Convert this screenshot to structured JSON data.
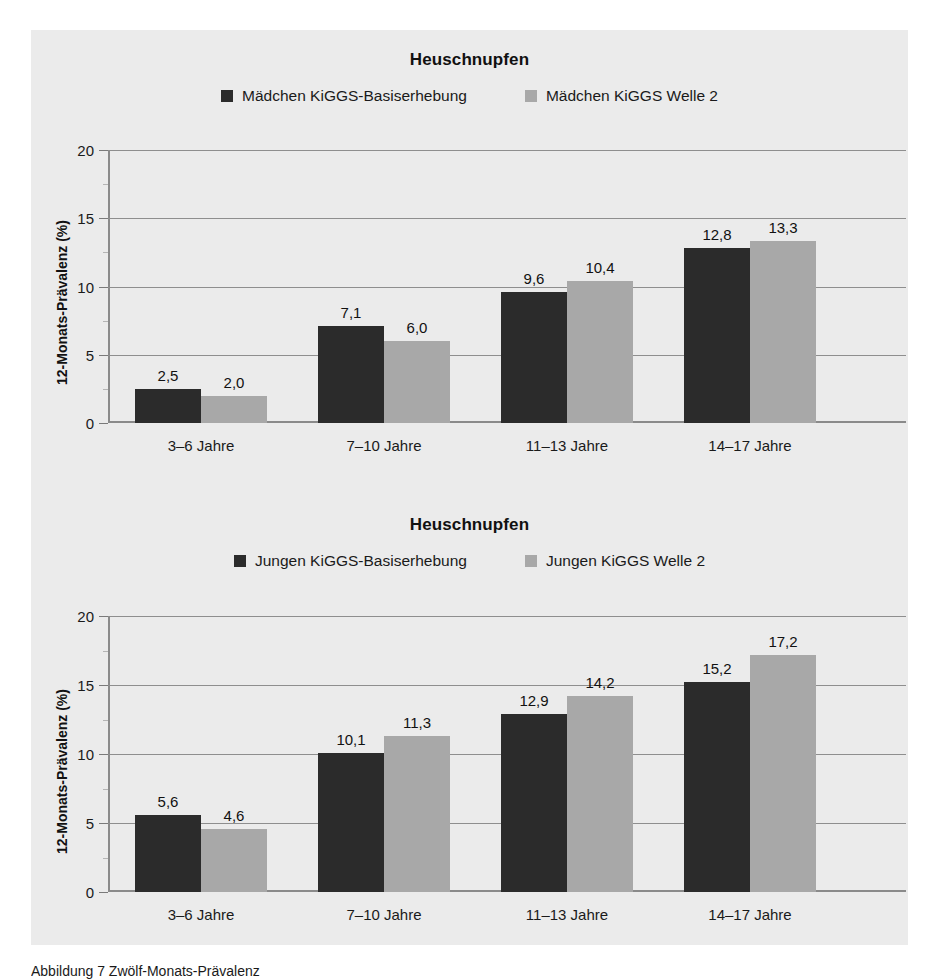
{
  "figure": {
    "caption": "Abbildung 7 Zwölf-Monats-Prävalenz"
  },
  "colors": {
    "series_baseline": "#2b2b2b",
    "series_welle2": "#a8a8a8",
    "panel_background": "#ebebeb",
    "axis": "#8a8a8a",
    "grid": "#8e8e8e",
    "text": "#1a1a1a"
  },
  "charts": [
    {
      "id": "maedchen",
      "title": "Heuschnupfen",
      "ylabel": "12-Monats-Prävalenz (%)",
      "legend": [
        {
          "label": "Mädchen KiGGS-Basiserhebung",
          "swatch": "#2b2b2b"
        },
        {
          "label": "Mädchen KiGGS Welle 2",
          "swatch": "#a8a8a8"
        }
      ],
      "yticks": [
        "0",
        "5",
        "10",
        "15",
        "20"
      ],
      "categories": [
        "3–6 Jahre",
        "7–10 Jahre",
        "11–13 Jahre",
        "14–17 Jahre"
      ],
      "bars": [
        {
          "value": 2.5,
          "label": "2,5",
          "series": 0
        },
        {
          "value": 2.0,
          "label": "2,0",
          "series": 1
        },
        {
          "value": 7.1,
          "label": "7,1",
          "series": 0
        },
        {
          "value": 6.0,
          "label": "6,0",
          "series": 1
        },
        {
          "value": 9.6,
          "label": "9,6",
          "series": 0
        },
        {
          "value": 10.4,
          "label": "10,4",
          "series": 1
        },
        {
          "value": 12.8,
          "label": "12,8",
          "series": 0
        },
        {
          "value": 13.3,
          "label": "13,3",
          "series": 1
        }
      ]
    },
    {
      "id": "jungen",
      "title": "Heuschnupfen",
      "ylabel": "12-Monats-Prävalenz (%)",
      "legend": [
        {
          "label": "Jungen KiGGS-Basiserhebung",
          "swatch": "#2b2b2b"
        },
        {
          "label": "Jungen KiGGS Welle 2",
          "swatch": "#a8a8a8"
        }
      ],
      "yticks": [
        "0",
        "5",
        "10",
        "15",
        "20"
      ],
      "categories": [
        "3–6 Jahre",
        "7–10 Jahre",
        "11–13 Jahre",
        "14–17 Jahre"
      ],
      "bars": [
        {
          "value": 5.6,
          "label": "5,6",
          "series": 0
        },
        {
          "value": 4.6,
          "label": "4,6",
          "series": 1
        },
        {
          "value": 10.1,
          "label": "10,1",
          "series": 0
        },
        {
          "value": 11.3,
          "label": "11,3",
          "series": 1
        },
        {
          "value": 12.9,
          "label": "12,9",
          "series": 0
        },
        {
          "value": 14.2,
          "label": "14,2",
          "series": 1
        },
        {
          "value": 15.2,
          "label": "15,2",
          "series": 0
        },
        {
          "value": 17.2,
          "label": "17,2",
          "series": 1
        }
      ]
    }
  ],
  "chart_data": [
    {
      "type": "bar",
      "title": "Heuschnupfen",
      "subtitle": "Mädchen",
      "xlabel": "",
      "ylabel": "12-Monats-Prävalenz (%)",
      "ylim": [
        0,
        20
      ],
      "yticks": [
        0,
        5,
        10,
        15,
        20
      ],
      "grid": true,
      "legend_position": "top-center",
      "categories": [
        "3–6 Jahre",
        "7–10 Jahre",
        "11–13 Jahre",
        "14–17 Jahre"
      ],
      "series": [
        {
          "name": "Mädchen KiGGS-Basiserhebung",
          "color": "#2b2b2b",
          "values": [
            2.5,
            7.1,
            9.6,
            12.8
          ]
        },
        {
          "name": "Mädchen KiGGS Welle 2",
          "color": "#a8a8a8",
          "values": [
            2.0,
            6.0,
            10.4,
            13.3
          ]
        }
      ]
    },
    {
      "type": "bar",
      "title": "Heuschnupfen",
      "subtitle": "Jungen",
      "xlabel": "",
      "ylabel": "12-Monats-Prävalenz (%)",
      "ylim": [
        0,
        20
      ],
      "yticks": [
        0,
        5,
        10,
        15,
        20
      ],
      "grid": true,
      "legend_position": "top-center",
      "categories": [
        "3–6 Jahre",
        "7–10 Jahre",
        "11–13 Jahre",
        "14–17 Jahre"
      ],
      "series": [
        {
          "name": "Jungen KiGGS-Basiserhebung",
          "color": "#2b2b2b",
          "values": [
            5.6,
            10.1,
            12.9,
            15.2
          ]
        },
        {
          "name": "Jungen KiGGS Welle 2",
          "color": "#a8a8a8",
          "values": [
            4.6,
            11.3,
            14.2,
            17.2
          ]
        }
      ]
    }
  ]
}
